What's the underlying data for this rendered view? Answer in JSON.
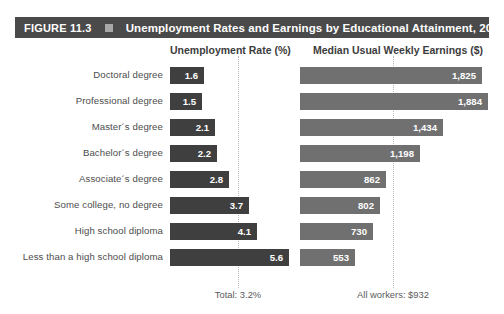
{
  "header": {
    "figure_number": "FIGURE 11.3",
    "separator_icon": "square-bullet-icon",
    "title": "Unemployment Rates and Earnings by Educational Attainment, 2018",
    "bar_color": "#4a4a4a"
  },
  "columns": {
    "unemployment_header": "Unemployment Rate (%)",
    "earnings_header": "Median Usual Weekly Earnings ($)"
  },
  "footnotes": {
    "total": "Total: 3.2%",
    "all_workers": "All workers: $932"
  },
  "colors": {
    "unemployment_bar": "#3f3f3f",
    "earnings_bar": "#707070",
    "reference_line": "#b9b9b9",
    "label_text": "#4d4d4d"
  },
  "rows": [
    {
      "label": "Doctoral degree",
      "unemployment_label": "1.6",
      "earnings_label": "1,825"
    },
    {
      "label": "Professional degree",
      "unemployment_label": "1.5",
      "earnings_label": "1,884"
    },
    {
      "label": "Master´s degree",
      "unemployment_label": "2.1",
      "earnings_label": "1,434"
    },
    {
      "label": "Bachelor´s degree",
      "unemployment_label": "2.2",
      "earnings_label": "1,198"
    },
    {
      "label": "Associate´s degree",
      "unemployment_label": "2.8",
      "earnings_label": "862"
    },
    {
      "label": "Some college, no degree",
      "unemployment_label": "3.7",
      "earnings_label": "802"
    },
    {
      "label": "High school diploma",
      "unemployment_label": "4.1",
      "earnings_label": "730"
    },
    {
      "label": "Less than a high school diploma",
      "unemployment_label": "5.6",
      "earnings_label": "553"
    }
  ],
  "chart_data": {
    "type": "bar",
    "title": "Unemployment Rates and Earnings by Educational Attainment, 2018",
    "subtitle": "FIGURE 11.3",
    "orientation": "horizontal",
    "grid": false,
    "legend_position": "none",
    "categories": [
      "Doctoral degree",
      "Professional degree",
      "Master´s degree",
      "Bachelor´s degree",
      "Associate´s degree",
      "Some college, no degree",
      "High school diploma",
      "Less than a high school diploma"
    ],
    "series": [
      {
        "name": "Unemployment Rate (%)",
        "unit": "percent",
        "values": [
          1.6,
          1.5,
          2.1,
          2.2,
          2.8,
          3.7,
          4.1,
          5.6
        ],
        "reference_line": {
          "label": "Total: 3.2%",
          "value": 3.2
        },
        "axis_max": 6.0,
        "color": "#3f3f3f"
      },
      {
        "name": "Median Usual Weekly Earnings ($)",
        "unit": "dollars_per_week",
        "values": [
          1825,
          1884,
          1434,
          1198,
          862,
          802,
          730,
          553
        ],
        "reference_line": {
          "label": "All workers: $932",
          "value": 932
        },
        "axis_max": 1950,
        "color": "#707070"
      }
    ],
    "xlabel": "",
    "ylabel": ""
  }
}
